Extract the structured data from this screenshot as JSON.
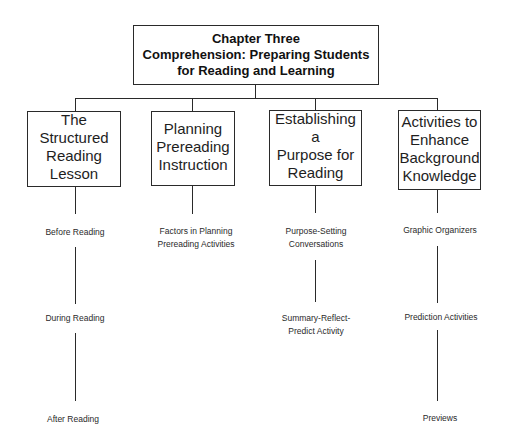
{
  "diagram": {
    "root": {
      "lines": [
        "Chapter Three",
        "Comprehension: Preparing Students",
        "for Reading and Learning"
      ]
    },
    "categories": [
      {
        "lines": [
          "The Structured",
          "Reading",
          "Lesson"
        ],
        "children": [
          {
            "lines": [
              "Before Reading"
            ]
          },
          {
            "lines": [
              "During Reading"
            ]
          },
          {
            "lines": [
              "After Reading"
            ]
          }
        ]
      },
      {
        "lines": [
          "Planning",
          "Prereading",
          "Instruction"
        ],
        "children": [
          {
            "lines": [
              "Factors in Planning",
              "Prereading Activities"
            ]
          }
        ]
      },
      {
        "lines": [
          "Establishing a",
          "Purpose for",
          "Reading"
        ],
        "children": [
          {
            "lines": [
              "Purpose-Setting",
              "Conversations"
            ]
          },
          {
            "lines": [
              "Summary-Reflect-",
              "Predict Activity"
            ]
          }
        ]
      },
      {
        "lines": [
          "Activities to",
          "Enhance",
          "Background",
          "Knowledge"
        ],
        "children": [
          {
            "lines": [
              "Graphic Organizers"
            ]
          },
          {
            "lines": [
              "Prediction Activities"
            ]
          },
          {
            "lines": [
              "Previews"
            ]
          }
        ]
      }
    ]
  },
  "colors": {
    "line": "#2a2a2a",
    "text": "#1a1a1a",
    "background": "#ffffff"
  }
}
